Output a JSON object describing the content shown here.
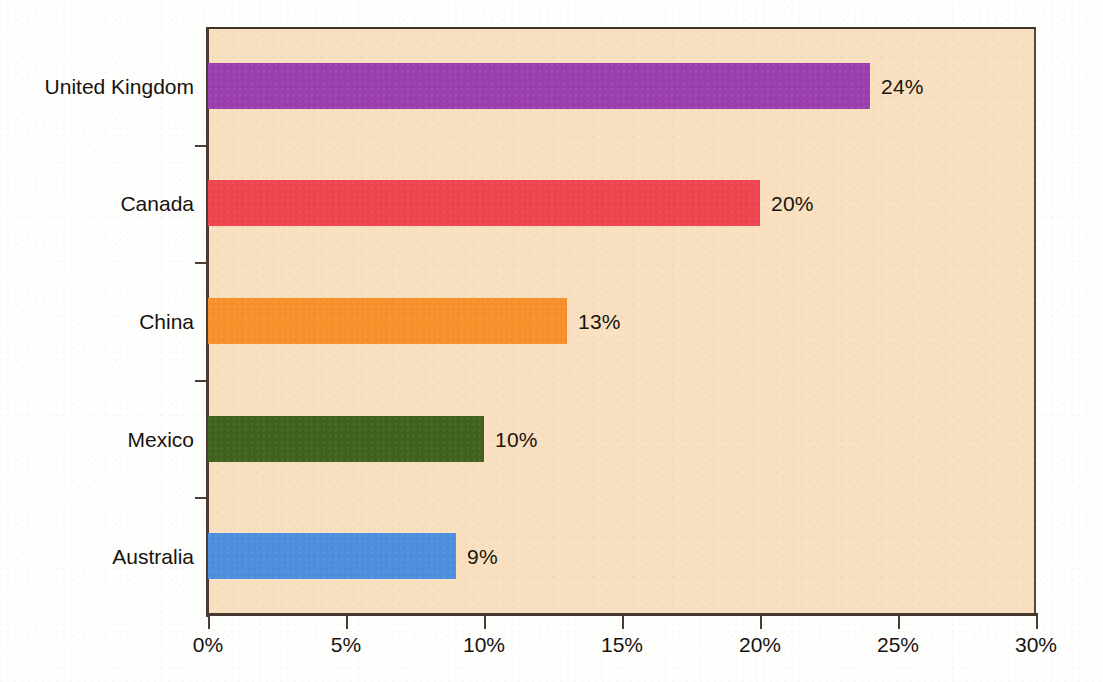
{
  "chart_data": {
    "type": "bar",
    "orientation": "horizontal",
    "title": "",
    "subtitle": "",
    "xlabel": "",
    "ylabel": "",
    "categories": [
      "United Kingdom",
      "Canada",
      "China",
      "Mexico",
      "Australia"
    ],
    "values": [
      24,
      20,
      13,
      10,
      9
    ],
    "value_labels": [
      "24%",
      "20%",
      "13%",
      "10%",
      "9%"
    ],
    "series": [
      {
        "name": "Percentage",
        "values": [
          24,
          20,
          13,
          10,
          9
        ]
      }
    ],
    "bar_colors": [
      "#9b3fae",
      "#ee4450",
      "#f7902a",
      "#41621f",
      "#4d8edc"
    ],
    "xlim": [
      0,
      30
    ],
    "xticks": [
      0,
      5,
      10,
      15,
      20,
      25,
      30
    ],
    "xtick_labels": [
      "0%",
      "5%",
      "10%",
      "15%",
      "20%",
      "25%",
      "30%"
    ],
    "grid": false,
    "legend": false,
    "legend_position": "none",
    "plot_background": "#f8e0c0",
    "page_background": "#fefefd",
    "axis_color": "#4a3c30"
  },
  "axis": {
    "x_tick_labels": [
      "0%",
      "5%",
      "10%",
      "15%",
      "20%",
      "25%",
      "30%"
    ],
    "y_tick_labels": [
      "United Kingdom",
      "Canada",
      "China",
      "Mexico",
      "Australia"
    ]
  },
  "bars": [
    {
      "category": "United Kingdom",
      "value": 24,
      "label": "24%",
      "color": "#9b3fae"
    },
    {
      "category": "Canada",
      "value": 20,
      "label": "20%",
      "color": "#ee4450"
    },
    {
      "category": "China",
      "value": 13,
      "label": "13%",
      "color": "#f7902a"
    },
    {
      "category": "Mexico",
      "value": 10,
      "label": "10%",
      "color": "#41621f"
    },
    {
      "category": "Australia",
      "value": 9,
      "label": "9%",
      "color": "#4d8edc"
    }
  ]
}
